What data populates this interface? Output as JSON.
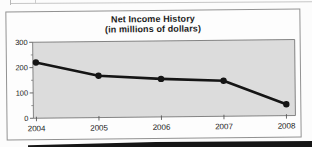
{
  "chart_data": {
    "type": "line",
    "title": "Net Income History",
    "subtitle": "(in millions of dollars)",
    "categories": [
      "2004",
      "2005",
      "2006",
      "2007",
      "2008"
    ],
    "values": [
      220,
      165,
      150,
      140,
      45
    ],
    "xlabel": "",
    "ylabel": "",
    "ylim": [
      0,
      300
    ],
    "yticks": [
      0,
      100,
      200,
      300
    ],
    "minor_yticks": [
      50,
      150,
      250
    ],
    "grid": false,
    "legend": "none",
    "marker": "circle",
    "line_color": "#151515",
    "plot_bg": "#dcdcdc",
    "axis_color": "#5a5a5a",
    "label_color": "#232323"
  }
}
